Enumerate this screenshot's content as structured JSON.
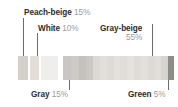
{
  "figure": {
    "type": "segmented-color-proportion-bar",
    "background": "#ffffff"
  },
  "callouts": [
    {
      "key": "peach-beige",
      "name": "Peach-beige",
      "pct": "15%",
      "layout": "inline",
      "label_x": 24,
      "label_y": 8,
      "leader": {
        "x": 23,
        "y": 18,
        "height": 38
      }
    },
    {
      "key": "white",
      "name": "White",
      "pct": "10%",
      "layout": "inline",
      "label_x": 38,
      "label_y": 24,
      "leader": {
        "x": 37,
        "y": 33,
        "height": 23
      }
    },
    {
      "key": "gray-beige",
      "name": "Gray-beige",
      "pct": "55%",
      "layout": "stacked",
      "label_x": 100,
      "label_y": 24,
      "leader": {
        "x": 152,
        "y": 24,
        "height": 32
      }
    },
    {
      "key": "gray",
      "name": "Gray",
      "pct": "15%",
      "layout": "inline",
      "label_x": 31,
      "label_y": 90,
      "leader": {
        "x": 69,
        "y": 70,
        "height": 20
      }
    },
    {
      "key": "green",
      "name": "Green",
      "pct": "5%",
      "layout": "inline",
      "label_x": 128,
      "label_y": 90,
      "leader": {
        "x": 168,
        "y": 70,
        "height": 20
      }
    }
  ],
  "chart_data": {
    "type": "bar",
    "title": "",
    "xlabel": "",
    "ylabel": "",
    "categories": [
      "Peach-beige",
      "White",
      "Gray-beige",
      "Gray",
      "Green"
    ],
    "values": [
      15,
      10,
      55,
      15,
      5
    ],
    "value_unit": "%",
    "colors": {
      "peach-beige": "#e9e4dd",
      "white": "#f4f3f1",
      "gray-beige": "#d9d6d1",
      "gray": "#bdbcba",
      "green": "#8e8e88",
      "leader_line": "#6d6d6d",
      "label_text": "#2b2b2b",
      "pct_text": "#9b9b9b"
    },
    "grid": false,
    "legend": "callout-labels"
  },
  "strips": {
    "left": {
      "segments": [
        {
          "key": "gray-beige",
          "color": "#d3d0ca",
          "width": 10
        },
        {
          "key": "gap-1",
          "color": "#ffffff",
          "width": 2
        },
        {
          "key": "peach-beige",
          "color": "#e2ded7",
          "width": 9
        },
        {
          "key": "gap-2",
          "color": "#ffffff",
          "width": 2
        },
        {
          "key": "white",
          "color": "#efeeec",
          "width": 17
        }
      ]
    },
    "right": {
      "segments": [
        {
          "key": "gray-1",
          "color": "#c8c6c2",
          "width": 8
        },
        {
          "key": "gray-2",
          "color": "#cecbc6",
          "width": 8
        },
        {
          "key": "gray-3",
          "color": "#c4c2be",
          "width": 8
        },
        {
          "key": "gray-4",
          "color": "#cbc8c3",
          "width": 7
        },
        {
          "key": "gray-beige-1",
          "color": "#dcd9d4",
          "width": 7
        },
        {
          "key": "gray-beige-2",
          "color": "#e2dfda",
          "width": 7
        },
        {
          "key": "gray-beige-3",
          "color": "#dedbd6",
          "width": 7
        },
        {
          "key": "gray-beige-4",
          "color": "#e4e1dc",
          "width": 7
        },
        {
          "key": "gray-beige-5",
          "color": "#e0ddd8",
          "width": 7
        },
        {
          "key": "gray-beige-6",
          "color": "#e5e2dd",
          "width": 7
        },
        {
          "key": "gray-beige-7",
          "color": "#dfdcd7",
          "width": 7
        },
        {
          "key": "gray-beige-8",
          "color": "#e3e0db",
          "width": 7
        },
        {
          "key": "gray-beige-9",
          "color": "#dddad5",
          "width": 7
        },
        {
          "key": "gray-beige-10",
          "color": "#e1ded9",
          "width": 7
        },
        {
          "key": "gray-beige-11",
          "color": "#d8d5d0",
          "width": 7
        },
        {
          "key": "green",
          "color": "#8e8e88",
          "width": 6
        }
      ]
    }
  }
}
